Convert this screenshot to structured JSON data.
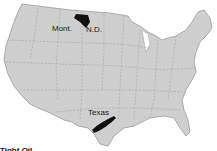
{
  "map": {
    "region": "Contiguous United States",
    "land_color": "#cfcfcf",
    "border_color": "#8a8a8a",
    "highlight_color": "#111111",
    "labels": {
      "montana": "Mont.",
      "north_dakota": "N.D.",
      "texas": "Texas"
    }
  },
  "caption": "Tight Oil"
}
